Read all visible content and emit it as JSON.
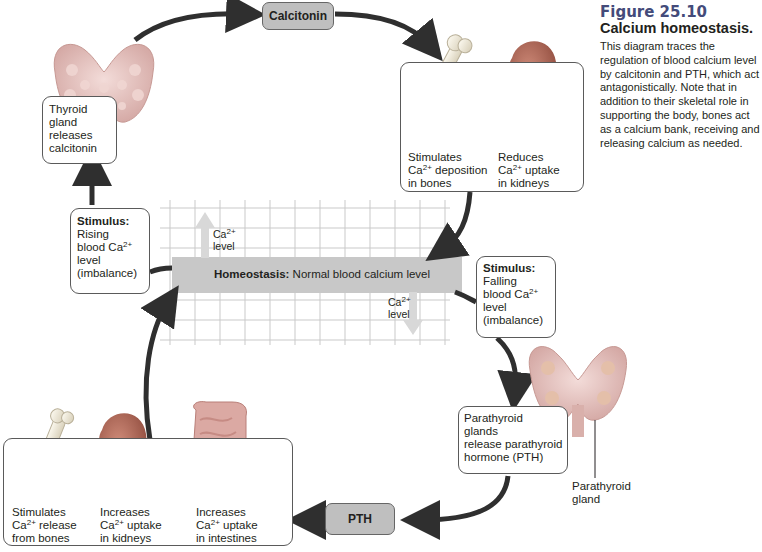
{
  "figure": {
    "number": "Figure 25.10",
    "title": "Calcium homeostasis.",
    "caption": "This diagram traces the regulation of blood calcium level by calcitonin and PTH, which act antagonistically. Note that in addition to their skeletal role in supporting the body, bones act as a calcium bank, receiving and releasing calcium as needed."
  },
  "hormones": {
    "calcitonin": "Calcitonin",
    "pth": "PTH"
  },
  "center": {
    "homeostasis_bold": "Homeostasis:",
    "homeostasis_text": " Normal blood calcium level",
    "up_label_line1": "Ca",
    "up_label_sup": "2+",
    "up_label_line2": "level",
    "down_label_line1": "Ca",
    "down_label_sup": "2+",
    "down_label_line2": "level"
  },
  "thyroid_box": {
    "line1": "Thyroid",
    "line2": "gland",
    "line3": "releases",
    "line4": "calcitonin"
  },
  "calcitonin_effects": {
    "bones": {
      "line1": "Stimulates",
      "line2a": "Ca",
      "sup": "2+",
      "line2b": " deposition",
      "line3": "in bones"
    },
    "kidneys": {
      "line1": "Reduces",
      "line2a": "Ca",
      "sup": "2+",
      "line2b": " uptake",
      "line3": "in kidneys"
    }
  },
  "stimulus_rising": {
    "title": "Stimulus:",
    "line1": "Rising",
    "line2a": "blood Ca",
    "sup": "2+",
    "line3": "level",
    "line4": "(imbalance)"
  },
  "stimulus_falling": {
    "title": "Stimulus:",
    "line1": "Falling",
    "line2a": "blood Ca",
    "sup": "2+",
    "line3": "level",
    "line4": "(imbalance)"
  },
  "parathyroid_box": {
    "line1": "Parathyroid",
    "line2": "glands",
    "line3": "release parathyroid",
    "line4": "hormone (PTH)"
  },
  "parathyroid_label": {
    "line1": "Parathyroid",
    "line2": "gland"
  },
  "pth_effects": {
    "bones": {
      "line1": "Stimulates",
      "line2a": "Ca",
      "sup": "2+",
      "line2b": " release",
      "line3": "from bones"
    },
    "kidneys": {
      "line1": "Increases",
      "line2a": "Ca",
      "sup": "2+",
      "line2b": " uptake",
      "line3": "in kidneys"
    },
    "intestines": {
      "line1": "Increases",
      "line2a": "Ca",
      "sup": "2+",
      "line2b": " uptake",
      "line3": "in intestines"
    }
  },
  "colors": {
    "arrow": "#2f2f2f",
    "pill": "#bfbfbf",
    "homeostasis_bar": "#c8c8c8",
    "grid": "#c9c9c9",
    "figure_number": "#444b7a",
    "thyroid": "#e8c7c4",
    "kidney": "#b46a5a",
    "bone": "#efe9d8",
    "intestine": "#dba9a3"
  }
}
